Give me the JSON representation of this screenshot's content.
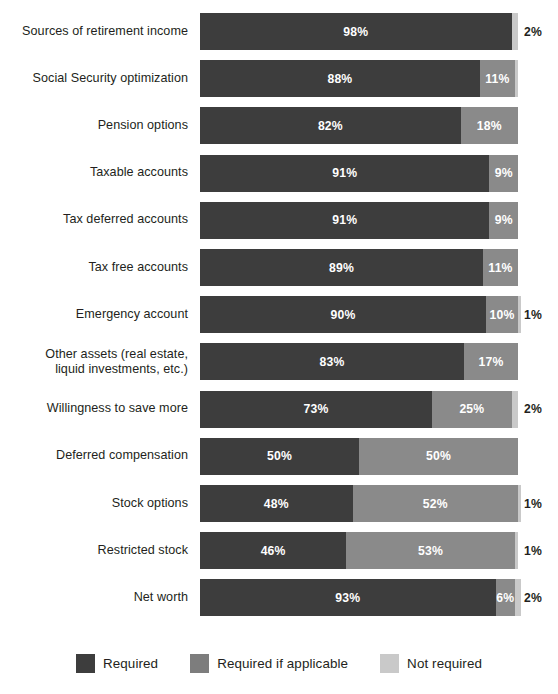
{
  "chart_data": {
    "type": "bar",
    "subtype": "horizontal-stacked-percent",
    "title": "",
    "xlabel": "",
    "ylabel": "",
    "xlim": [
      0,
      100
    ],
    "grid": false,
    "legend_position": "bottom-center",
    "colors": {
      "required": "#3d3d3d",
      "applicable": "#8a8a8a",
      "notrequired": "#c9c9c9"
    },
    "legend": [
      {
        "label": "Required",
        "color": "#3d3d3d",
        "key": "required"
      },
      {
        "label": "Required if applicable",
        "color": "#7d7d7d",
        "key": "applicable"
      },
      {
        "label": "Not required",
        "color": "#c9c9c9",
        "key": "notrequired"
      }
    ],
    "categories": [
      "Sources of retirement income",
      "Social Security optimization",
      "Pension options",
      "Taxable accounts",
      "Tax deferred accounts",
      "Tax free accounts",
      "Emergency account",
      "Other assets (real estate,\nliquid investments, etc.)",
      "Willingness to save more",
      "Deferred compensation",
      "Stock options",
      "Restricted stock",
      "Net worth"
    ],
    "series": [
      {
        "name": "Required",
        "values": [
          98,
          88,
          82,
          91,
          91,
          89,
          90,
          83,
          73,
          50,
          48,
          46,
          93
        ]
      },
      {
        "name": "Required if applicable",
        "values": [
          0,
          11,
          18,
          9,
          9,
          11,
          10,
          17,
          25,
          50,
          52,
          53,
          6
        ]
      },
      {
        "name": "Not required",
        "values": [
          2,
          1,
          0,
          0,
          0,
          0,
          1,
          0,
          2,
          0,
          1,
          1,
          2
        ]
      }
    ]
  },
  "rows": [
    {
      "label": "Sources of retirement income",
      "segments": [
        {
          "key": "required",
          "value": 98,
          "text": "98%",
          "inside": true
        },
        {
          "key": "notrequired",
          "value": 2,
          "text": "2%",
          "inside": false
        }
      ]
    },
    {
      "label": "Social Security optimization",
      "segments": [
        {
          "key": "required",
          "value": 88,
          "text": "88%",
          "inside": true
        },
        {
          "key": "applicable",
          "value": 11,
          "text": "11%",
          "inside": true
        },
        {
          "key": "notrequired",
          "value": 1,
          "text": "",
          "inside": true
        }
      ]
    },
    {
      "label": "Pension options",
      "segments": [
        {
          "key": "required",
          "value": 82,
          "text": "82%",
          "inside": true
        },
        {
          "key": "applicable",
          "value": 18,
          "text": "18%",
          "inside": true
        }
      ]
    },
    {
      "label": "Taxable accounts",
      "segments": [
        {
          "key": "required",
          "value": 91,
          "text": "91%",
          "inside": true
        },
        {
          "key": "applicable",
          "value": 9,
          "text": "9%",
          "inside": true
        }
      ]
    },
    {
      "label": "Tax deferred accounts",
      "segments": [
        {
          "key": "required",
          "value": 91,
          "text": "91%",
          "inside": true
        },
        {
          "key": "applicable",
          "value": 9,
          "text": "9%",
          "inside": true
        }
      ]
    },
    {
      "label": "Tax free accounts",
      "segments": [
        {
          "key": "required",
          "value": 89,
          "text": "89%",
          "inside": true
        },
        {
          "key": "applicable",
          "value": 11,
          "text": "11%",
          "inside": true
        }
      ]
    },
    {
      "label": "Emergency account",
      "segments": [
        {
          "key": "required",
          "value": 90,
          "text": "90%",
          "inside": true
        },
        {
          "key": "applicable",
          "value": 10,
          "text": "10%",
          "inside": true
        },
        {
          "key": "notrequired",
          "value": 1,
          "text": "1%",
          "inside": false
        }
      ]
    },
    {
      "label": "Other assets (real estate,\nliquid investments, etc.)",
      "segments": [
        {
          "key": "required",
          "value": 83,
          "text": "83%",
          "inside": true
        },
        {
          "key": "applicable",
          "value": 17,
          "text": "17%",
          "inside": true
        }
      ]
    },
    {
      "label": "Willingness to save more",
      "segments": [
        {
          "key": "required",
          "value": 73,
          "text": "73%",
          "inside": true
        },
        {
          "key": "applicable",
          "value": 25,
          "text": "25%",
          "inside": true
        },
        {
          "key": "notrequired",
          "value": 2,
          "text": "2%",
          "inside": false
        }
      ]
    },
    {
      "label": "Deferred compensation",
      "segments": [
        {
          "key": "required",
          "value": 50,
          "text": "50%",
          "inside": true
        },
        {
          "key": "applicable",
          "value": 50,
          "text": "50%",
          "inside": true
        }
      ]
    },
    {
      "label": "Stock options",
      "segments": [
        {
          "key": "required",
          "value": 48,
          "text": "48%",
          "inside": true
        },
        {
          "key": "applicable",
          "value": 52,
          "text": "52%",
          "inside": true
        },
        {
          "key": "notrequired",
          "value": 1,
          "text": "1%",
          "inside": false
        }
      ]
    },
    {
      "label": "Restricted stock",
      "segments": [
        {
          "key": "required",
          "value": 46,
          "text": "46%",
          "inside": true
        },
        {
          "key": "applicable",
          "value": 53,
          "text": "53%",
          "inside": true
        },
        {
          "key": "notrequired",
          "value": 1,
          "text": "1%",
          "inside": false
        }
      ]
    },
    {
      "label": "Net worth",
      "segments": [
        {
          "key": "required",
          "value": 93,
          "text": "93%",
          "inside": true
        },
        {
          "key": "applicable",
          "value": 6,
          "text": "6%",
          "inside": true
        },
        {
          "key": "notrequired",
          "value": 2,
          "text": "2%",
          "inside": false
        }
      ]
    }
  ],
  "legend": {
    "items": [
      {
        "label": "Required",
        "key": "required"
      },
      {
        "label": "Required if applicable",
        "key": "applicable"
      },
      {
        "label": "Not required",
        "key": "notrequired"
      }
    ]
  }
}
